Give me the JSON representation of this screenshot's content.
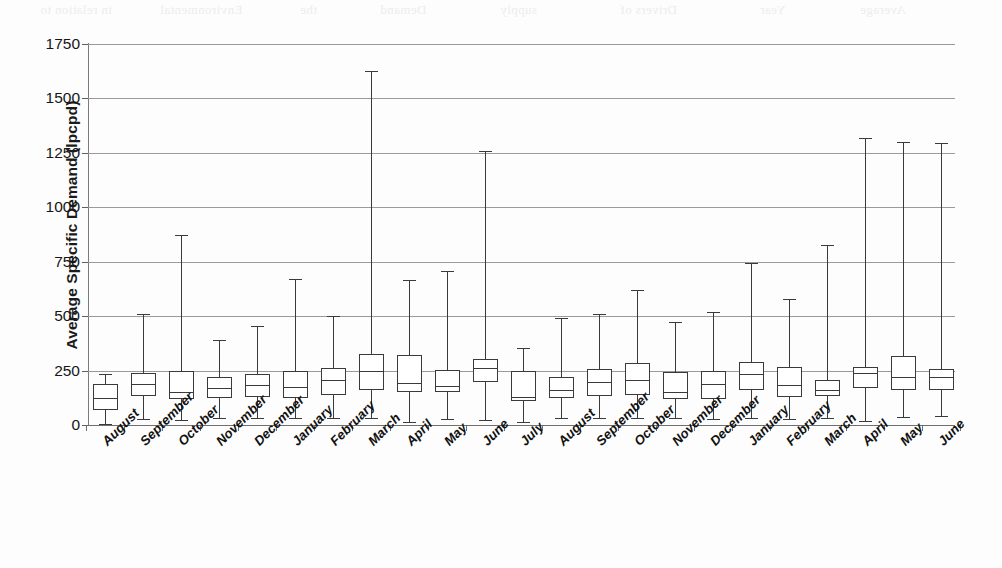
{
  "figure": {
    "kind": "box-plot-chart",
    "background_color": "#ffffff",
    "line_color": "#3a3a3a",
    "grid_color": "#9a9a9a"
  },
  "bleed_through_text": [
    "in relation to",
    "Environmental",
    "the",
    "Demand",
    "supply",
    "Drivers of",
    "Year",
    "Average"
  ],
  "chart_data": {
    "type": "box",
    "title": "",
    "xlabel": "",
    "ylabel": "Average Specific Demand (lpcpd)",
    "ylim": [
      0,
      1750
    ],
    "yticks": [
      0,
      250,
      500,
      750,
      1000,
      1250,
      1500,
      1750
    ],
    "ytick_labels": [
      "0",
      "250",
      "500",
      "750",
      "1000",
      "1250",
      "1500",
      "1750"
    ],
    "grid": true,
    "legend": "none",
    "categories": [
      "August",
      "September",
      "October",
      "November",
      "December",
      "January",
      "February",
      "March",
      "April",
      "May",
      "June",
      "July",
      "August",
      "September",
      "October",
      "November",
      "December",
      "January",
      "February",
      "March",
      "April",
      "May",
      "June"
    ],
    "boxes": [
      {
        "category": "August",
        "whisker_low": 5,
        "q1": 69,
        "median": 124,
        "q3": 188,
        "whisker_high": 234
      },
      {
        "category": "September",
        "whisker_low": 28,
        "q1": 133,
        "median": 190,
        "q3": 238,
        "whisker_high": 510
      },
      {
        "category": "October",
        "whisker_low": 25,
        "q1": 120,
        "median": 152,
        "q3": 248,
        "whisker_high": 875
      },
      {
        "category": "November",
        "whisker_low": 34,
        "q1": 122,
        "median": 168,
        "q3": 222,
        "whisker_high": 390
      },
      {
        "category": "December",
        "whisker_low": 30,
        "q1": 128,
        "median": 186,
        "q3": 236,
        "whisker_high": 455
      },
      {
        "category": "January",
        "whisker_low": 32,
        "q1": 126,
        "median": 175,
        "q3": 246,
        "whisker_high": 670
      },
      {
        "category": "February",
        "whisker_low": 30,
        "q1": 140,
        "median": 205,
        "q3": 262,
        "whisker_high": 500
      },
      {
        "category": "March",
        "whisker_low": 32,
        "q1": 160,
        "median": 246,
        "q3": 328,
        "whisker_high": 1625
      },
      {
        "category": "April",
        "whisker_low": 12,
        "q1": 152,
        "median": 192,
        "q3": 322,
        "whisker_high": 668
      },
      {
        "category": "May",
        "whisker_low": 26,
        "q1": 152,
        "median": 180,
        "q3": 252,
        "whisker_high": 708
      },
      {
        "category": "June",
        "whisker_low": 24,
        "q1": 196,
        "median": 262,
        "q3": 302,
        "whisker_high": 1258
      },
      {
        "category": "July",
        "whisker_low": 12,
        "q1": 108,
        "median": 130,
        "q3": 250,
        "whisker_high": 352
      },
      {
        "category": "August",
        "whisker_low": 30,
        "q1": 125,
        "median": 160,
        "q3": 222,
        "whisker_high": 492
      },
      {
        "category": "September",
        "whisker_low": 32,
        "q1": 135,
        "median": 198,
        "q3": 258,
        "whisker_high": 512
      },
      {
        "category": "October",
        "whisker_low": 32,
        "q1": 140,
        "median": 208,
        "q3": 285,
        "whisker_high": 618
      },
      {
        "category": "November",
        "whisker_low": 30,
        "q1": 118,
        "median": 152,
        "q3": 242,
        "whisker_high": 475
      },
      {
        "category": "December",
        "whisker_low": 28,
        "q1": 118,
        "median": 190,
        "q3": 250,
        "whisker_high": 518
      },
      {
        "category": "January",
        "whisker_low": 30,
        "q1": 162,
        "median": 232,
        "q3": 288,
        "whisker_high": 745
      },
      {
        "category": "February",
        "whisker_low": 28,
        "q1": 130,
        "median": 182,
        "q3": 265,
        "whisker_high": 580
      },
      {
        "category": "March",
        "whisker_low": 30,
        "q1": 132,
        "median": 162,
        "q3": 205,
        "whisker_high": 825
      },
      {
        "category": "April",
        "whisker_low": 18,
        "q1": 168,
        "median": 238,
        "q3": 268,
        "whisker_high": 1320
      },
      {
        "category": "May",
        "whisker_low": 38,
        "q1": 162,
        "median": 222,
        "q3": 318,
        "whisker_high": 1300
      },
      {
        "category": "June",
        "whisker_low": 40,
        "q1": 160,
        "median": 222,
        "q3": 255,
        "whisker_high": 1295
      }
    ]
  }
}
